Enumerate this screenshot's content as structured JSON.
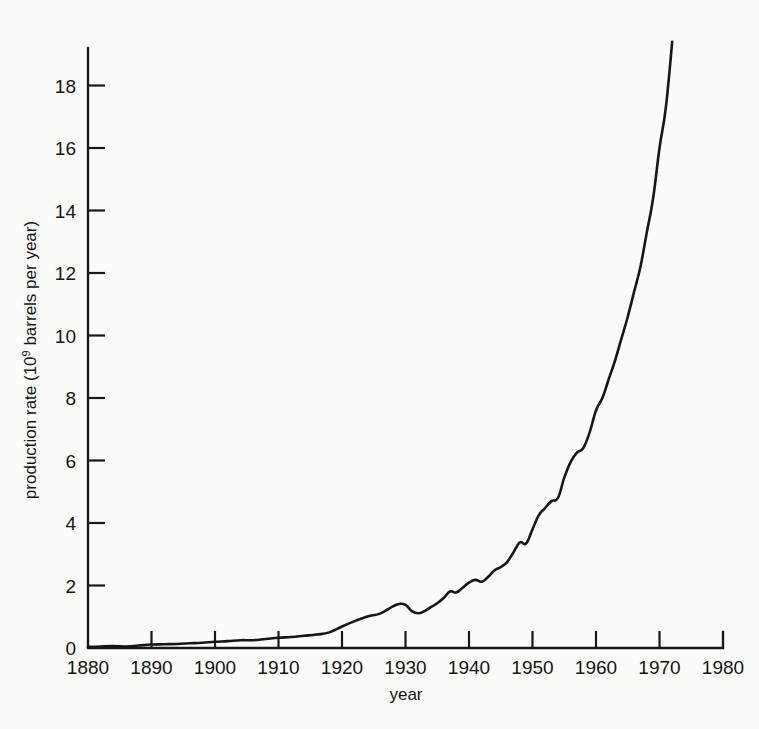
{
  "chart_data": {
    "type": "line",
    "title": "",
    "xlabel": "year",
    "ylabel": "production rate (10⁹ barrels per year)",
    "ylabel_prefix": "production rate (10",
    "ylabel_sup": "9",
    "ylabel_suffix": " barrels per year)",
    "xlim": [
      1880,
      1980
    ],
    "ylim": [
      0,
      19.6
    ],
    "grid": false,
    "legend": null,
    "xticks": [
      1880,
      1890,
      1900,
      1910,
      1920,
      1930,
      1940,
      1950,
      1960,
      1970,
      1980
    ],
    "xtick_labels": [
      "1880",
      "1890",
      "1900",
      "1910",
      "1920",
      "1930",
      "1940",
      "1950",
      "1960",
      "1970",
      "1980"
    ],
    "yticks": [
      0,
      2,
      4,
      6,
      8,
      10,
      12,
      14,
      16,
      18
    ],
    "ytick_labels": [
      "0",
      "2",
      "4",
      "6",
      "8",
      "10",
      "12",
      "14",
      "16",
      "18"
    ],
    "series": [
      {
        "name": "world crude oil production rate",
        "x": [
          1880,
          1882,
          1884,
          1886,
          1888,
          1890,
          1892,
          1894,
          1896,
          1898,
          1900,
          1902,
          1904,
          1906,
          1908,
          1910,
          1912,
          1914,
          1916,
          1918,
          1920,
          1922,
          1924,
          1926,
          1928,
          1929,
          1930,
          1931,
          1932,
          1933,
          1934,
          1935,
          1936,
          1937,
          1938,
          1939,
          1940,
          1941,
          1942,
          1943,
          1944,
          1945,
          1946,
          1947,
          1948,
          1949,
          1950,
          1951,
          1952,
          1953,
          1954,
          1955,
          1956,
          1957,
          1958,
          1959,
          1960,
          1961,
          1962,
          1963,
          1964,
          1965,
          1966,
          1967,
          1968,
          1969,
          1970,
          1971,
          1972
        ],
        "y": [
          0.03,
          0.05,
          0.06,
          0.05,
          0.08,
          0.11,
          0.12,
          0.13,
          0.15,
          0.17,
          0.2,
          0.22,
          0.25,
          0.25,
          0.29,
          0.33,
          0.35,
          0.39,
          0.43,
          0.5,
          0.69,
          0.86,
          1.01,
          1.1,
          1.33,
          1.41,
          1.38,
          1.18,
          1.11,
          1.18,
          1.31,
          1.43,
          1.6,
          1.81,
          1.78,
          1.93,
          2.09,
          2.18,
          2.12,
          2.27,
          2.48,
          2.59,
          2.75,
          3.06,
          3.38,
          3.35,
          3.8,
          4.25,
          4.48,
          4.7,
          4.8,
          5.45,
          5.95,
          6.25,
          6.4,
          6.9,
          7.6,
          8.0,
          8.6,
          9.2,
          9.9,
          10.6,
          11.4,
          12.2,
          13.3,
          14.4,
          16.0,
          17.3,
          19.4
        ]
      }
    ]
  },
  "axes": {
    "x_axis_name": "year-axis",
    "y_axis_name": "production-rate-axis"
  }
}
